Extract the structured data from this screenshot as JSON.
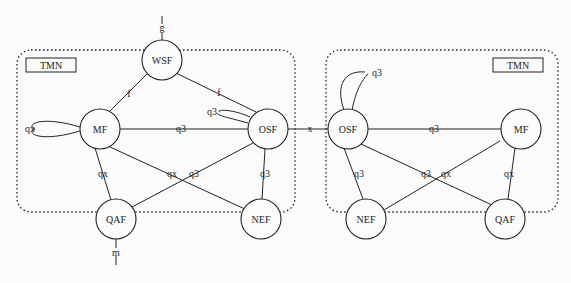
{
  "diagram": {
    "domains": [
      {
        "id": "tmn-left",
        "label": "TMN"
      },
      {
        "id": "tmn-right",
        "label": "TMN"
      }
    ],
    "nodes": {
      "wsf": "WSF",
      "mf_left": "MF",
      "osf_left": "OSF",
      "qaf_left": "QAF",
      "nef_left": "NEF",
      "osf_right": "OSF",
      "mf_right": "MF",
      "nef_right": "NEF",
      "qaf_right": "QAF"
    },
    "reference_points": {
      "g": "g",
      "m": "m",
      "f_mf_wsf": "f",
      "f_wsf_osf": "f",
      "q3_mf_osf": "q3",
      "q3_osf_self": "q3",
      "qx_mf_self": "qx",
      "qx_mf_qaf": "qx",
      "qx_mf_nef": "qx",
      "q3_osf_qaf": "q3",
      "q3_osf_nef": "q3",
      "x_osf_osf": "x",
      "q3_rosf_self": "q3",
      "q3_rosf_rmf": "q3",
      "q3_rosf_nef": "q3",
      "q3_rosf_qaf": "q3",
      "qx_rmf_nef": "qx",
      "qx_rmf_qaf": "qx"
    },
    "edges": [
      [
        "WSF",
        "MF",
        "f"
      ],
      [
        "WSF",
        "OSF",
        "f"
      ],
      [
        "MF",
        "OSF",
        "q3"
      ],
      [
        "MF",
        "MF",
        "qx"
      ],
      [
        "OSF",
        "OSF",
        "q3"
      ],
      [
        "MF",
        "QAF",
        "qx"
      ],
      [
        "MF",
        "NEF",
        "qx"
      ],
      [
        "OSF",
        "QAF",
        "q3"
      ],
      [
        "OSF",
        "NEF",
        "q3"
      ],
      [
        "OSF",
        "OSF(remote)",
        "x"
      ],
      [
        "WSF",
        "user",
        "g"
      ],
      [
        "QAF",
        "non-TMN",
        "m"
      ]
    ]
  }
}
